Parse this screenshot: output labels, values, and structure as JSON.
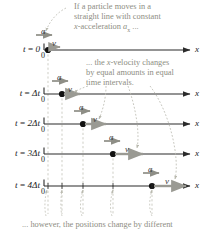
{
  "figure": {
    "type": "motion-diagram"
  },
  "callouts": {
    "top": {
      "line1": "If a particle moves in a",
      "line2": "straight line with constant",
      "line3_pre": "x",
      "line3_mid": "-acceleration ",
      "line3_sym": "a",
      "line3_sub": "x",
      "line3_post": " ..."
    },
    "middle": {
      "line1_pre": "... the ",
      "line1_it": "x",
      "line1_post": "-velocity changes",
      "line2": "by equal amounts in equal",
      "line3": "time intervals."
    },
    "bottom": {
      "line1": "... however, the positions change by different"
    }
  },
  "rows": [
    {
      "time_t": "t",
      "time_eq": " = ",
      "time_val": "0",
      "zero": "0",
      "axis": "x",
      "v_label": "v",
      "a_label": "a",
      "dot_x": 48,
      "v_len": 8,
      "has_a": false
    },
    {
      "time_t": "t",
      "time_eq": " = ",
      "time_val": "Δt",
      "zero": "0",
      "axis": "x",
      "v_label": "v",
      "a_label": "a",
      "dot_x": 62,
      "v_len": 15,
      "has_a": true
    },
    {
      "time_t": "t",
      "time_eq": " = ",
      "time_val": "2Δt",
      "zero": "0",
      "axis": "x",
      "v_label": "v",
      "a_label": "a",
      "dot_x": 83,
      "v_len": 22,
      "has_a": true
    },
    {
      "time_t": "t",
      "time_eq": " = ",
      "time_val": "3Δt",
      "zero": "0",
      "axis": "x",
      "v_label": "v",
      "a_label": "a",
      "dot_x": 113,
      "v_len": 29,
      "has_a": true
    },
    {
      "time_t": "t",
      "time_eq": " = ",
      "time_val": "4Δt",
      "zero": "0",
      "axis": "x",
      "v_label": "v",
      "a_label": "a",
      "dot_x": 152,
      "v_len": 36,
      "has_a": true
    }
  ],
  "colors": {
    "axis": "#2b2b2b",
    "dot": "#111111",
    "velocity_arrow": "#9a9a93",
    "acceleration_arrow": "#8e8e86",
    "callout_text": "#8d8d82",
    "leader_line": "#b9b9ae",
    "guide_dash": "#b9b9ae",
    "label_text": "#1a1a1a"
  }
}
